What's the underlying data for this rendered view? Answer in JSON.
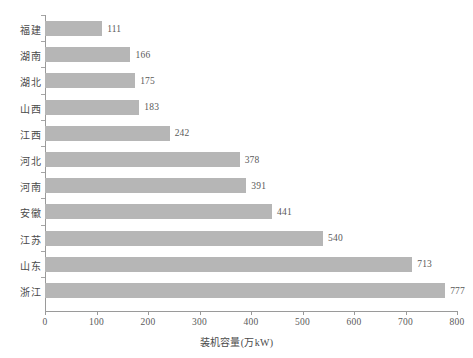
{
  "chart_data": {
    "type": "bar",
    "orientation": "horizontal",
    "title": "",
    "xlabel": "装机容量(万kW)",
    "ylabel": "",
    "categories": [
      "福建",
      "湖南",
      "湖北",
      "山西",
      "江西",
      "河北",
      "河南",
      "安徽",
      "江苏",
      "山东",
      "浙江"
    ],
    "values": [
      111,
      166,
      175,
      183,
      242,
      378,
      391,
      441,
      540,
      713,
      777
    ],
    "value_labels": [
      "111",
      "166",
      "175",
      "183",
      "242",
      "378",
      "391",
      "441",
      "540",
      "713",
      "777"
    ],
    "xlim": [
      0,
      800
    ],
    "xticks": [
      0,
      100,
      200,
      300,
      400,
      500,
      600,
      700,
      800
    ],
    "xtick_labels": [
      "0",
      "100",
      "200",
      "300",
      "400",
      "500",
      "600",
      "700",
      "800"
    ],
    "grid": false,
    "legend": null,
    "bar_color": "#b6b6b6",
    "axis_color": "#9a9a9a",
    "text_color": "#4a4a4a",
    "background_color": "#ffffff"
  }
}
